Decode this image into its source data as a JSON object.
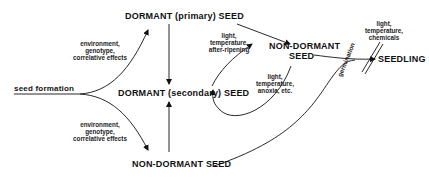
{
  "diagram": {
    "nodes": {
      "seed_formation": "seed formation",
      "dormant_primary": "DORMANT (primary) SEED",
      "dormant_secondary": "DORMANT (secondary) SEED",
      "non_dormant_top_line1": "NON-DORMANT",
      "non_dormant_top_line2": "SEED",
      "non_dormant_bottom": "NON-DORMANT SEED",
      "seedling": "SEEDLING"
    },
    "edge_labels": {
      "upper_left": [
        "environment,",
        "genotype,",
        "correlative effects"
      ],
      "lower_left": [
        "environment,",
        "genotype,",
        "correlative effects"
      ],
      "primary_to_nondormant": [
        "light,",
        "temperature,",
        "after-ripening"
      ],
      "nondormant_to_secondary": [
        "light,",
        "temperature,",
        "anoxia, etc."
      ],
      "seedling_factors": [
        "light,",
        "temperature,",
        "chemicals"
      ],
      "germination": "germination"
    },
    "colors": {
      "ink": "#111111",
      "background": "#ffffff"
    }
  }
}
